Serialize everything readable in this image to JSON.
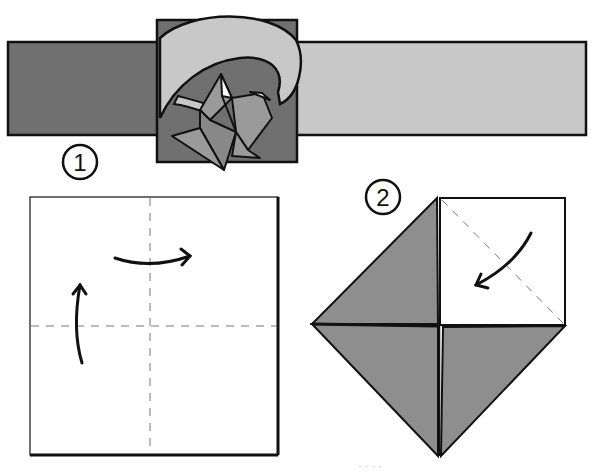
{
  "diagram": {
    "type": "origami-instructions",
    "colors": {
      "paper_dark": "#707070",
      "paper_light": "#c8c8c8",
      "paper_mid": "#9a9a9a",
      "paper_white": "#ffffff",
      "outline": "#111111",
      "crease": "#777777"
    },
    "banner": {
      "left_strip": "dark-gray strip",
      "right_strip": "light-gray strip",
      "center_tile": "folded model emblem on dark square"
    },
    "steps": [
      {
        "number": "1",
        "description": "Valley-fold in half both ways and unfold",
        "creases": [
          "vertical-center",
          "horizontal-center"
        ],
        "arrows": [
          "fold-right-arrow",
          "fold-up-arrow"
        ]
      },
      {
        "number": "2",
        "description": "Fold corners to the center (blintz)",
        "creases": [
          "diagonal-top-right"
        ],
        "arrows": [
          "fold-corner-arrow"
        ]
      }
    ],
    "caption": "· · · ·"
  }
}
